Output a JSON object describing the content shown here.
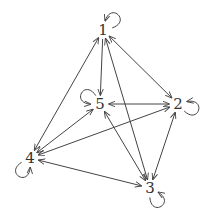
{
  "diagram": {
    "type": "directed-graph",
    "stroke_color": "#444444",
    "label_color": "#333333",
    "nodes": [
      {
        "id": "1",
        "label": "1",
        "x": 103,
        "y": 30
      },
      {
        "id": "2",
        "label": "2",
        "x": 178,
        "y": 104
      },
      {
        "id": "3",
        "label": "3",
        "x": 150,
        "y": 188
      },
      {
        "id": "4",
        "label": "4",
        "x": 30,
        "y": 158
      },
      {
        "id": "5",
        "label": "5",
        "x": 100,
        "y": 104
      }
    ],
    "self_loops": [
      "1",
      "2",
      "3",
      "4",
      "5"
    ],
    "edges": [
      {
        "from": "1",
        "to": "5",
        "bidirectional": false
      },
      {
        "from": "1",
        "to": "2",
        "bidirectional": true
      },
      {
        "from": "1",
        "to": "4",
        "bidirectional": true
      },
      {
        "from": "1",
        "to": "3",
        "bidirectional": true
      },
      {
        "from": "5",
        "to": "2",
        "bidirectional": true
      },
      {
        "from": "5",
        "to": "4",
        "bidirectional": true
      },
      {
        "from": "3",
        "to": "5",
        "bidirectional": true
      },
      {
        "from": "2",
        "to": "4",
        "bidirectional": true
      },
      {
        "from": "2",
        "to": "3",
        "bidirectional": true
      },
      {
        "from": "4",
        "to": "3",
        "bidirectional": true
      }
    ]
  }
}
